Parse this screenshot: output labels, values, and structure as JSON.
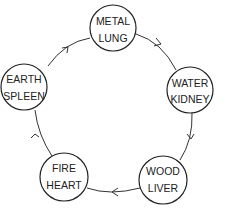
{
  "diagram": {
    "type": "cycle",
    "direction": "clockwise",
    "nodes": [
      {
        "id": "metal",
        "line1": "METAL",
        "line2": "LUNG"
      },
      {
        "id": "water",
        "line1": "WATER",
        "line2": "KIDNEY"
      },
      {
        "id": "wood",
        "line1": "WOOD",
        "line2": "LIVER"
      },
      {
        "id": "fire",
        "line1": "FIRE",
        "line2": "HEART"
      },
      {
        "id": "earth",
        "line1": "EARTH",
        "line2": "SPLEEN"
      }
    ],
    "edges": [
      {
        "from": "metal",
        "to": "water"
      },
      {
        "from": "water",
        "to": "wood"
      },
      {
        "from": "wood",
        "to": "fire"
      },
      {
        "from": "fire",
        "to": "earth"
      },
      {
        "from": "earth",
        "to": "metal"
      }
    ],
    "colors": {
      "stroke": "#222222",
      "background": "#ffffff"
    }
  }
}
